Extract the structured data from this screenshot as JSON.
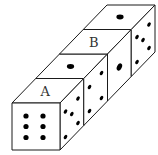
{
  "diagram": {
    "title": "",
    "colors": {
      "background": "#ffffff",
      "line": "#1a1a1a",
      "pip": "#000000",
      "label": "#333333"
    },
    "dice": [
      {
        "index": 1,
        "front_pips": 6,
        "top_pips": 0,
        "top_label": "A",
        "right_pips": 5
      },
      {
        "index": 2,
        "top_pips": 1,
        "top_label": "",
        "right_pips": 4
      },
      {
        "index": 3,
        "top_pips": 0,
        "top_label": "B",
        "right_pips": 1
      },
      {
        "index": 4,
        "top_pips": 1,
        "top_label": "",
        "right_pips": 5
      }
    ],
    "labels": {
      "a": "A",
      "b": "B"
    }
  }
}
